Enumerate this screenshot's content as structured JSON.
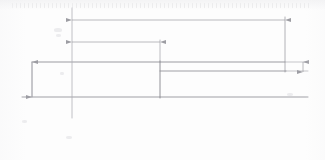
{
  "drawing": {
    "title": "Stepped part profile — dimensioned technical sketch",
    "type": "engineering-line-drawing",
    "background_color": "#fdfdfd",
    "line_color": "#8c8c92",
    "thin_line_color": "#aeaeb4",
    "label_color": "#9a9a9f",
    "canvas": {
      "width": 325,
      "height": 160
    }
  },
  "dimensions": {
    "overall_length": {
      "label": "",
      "name": "overall-length-dimension",
      "from_x": 72,
      "to_x": 285,
      "y": 20,
      "label_x": 188
    },
    "step_length": {
      "label": "",
      "name": "step-length-dimension",
      "from_x": 72,
      "to_x": 160,
      "y": 42,
      "label_x": 110
    },
    "major_height": {
      "label": "",
      "name": "major-height-dimension",
      "x": 32,
      "from_y": 62,
      "to_y": 97,
      "label_y": 80
    },
    "minor_height": {
      "label": "",
      "name": "minor-height-dimension",
      "x": 303,
      "from_y": 62,
      "to_y": 72,
      "label_y": 67
    }
  },
  "geometry": {
    "baseline": {
      "x1": 22,
      "y1": 97,
      "x2": 308,
      "y2": 97
    },
    "centerline": {
      "x": 72,
      "y1": 8,
      "y2": 118
    },
    "top_edge": {
      "x1": 32,
      "y1": 62,
      "x2": 285,
      "y2": 62
    },
    "step_face": {
      "x": 160,
      "y1": 62,
      "y2": 97
    },
    "step_lower_edge": {
      "x1": 160,
      "y1": 71,
      "x2": 285,
      "y2": 71
    },
    "right_edge": {
      "x": 285,
      "y1": 18,
      "y2": 72
    }
  }
}
